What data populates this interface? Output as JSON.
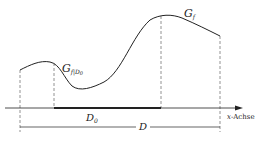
{
  "diagram": {
    "colors": {
      "stroke": "#222222",
      "dashed": "#777777",
      "background": "#ffffff"
    },
    "labels": {
      "graph_f": {
        "main": "G",
        "sub": "f"
      },
      "graph_restricted": {
        "main": "G",
        "sub": "f|D",
        "subsub": "0"
      },
      "subdomain": {
        "main": "D",
        "sub": "0"
      },
      "domain": "D",
      "axis": {
        "var": "x",
        "rest": "-Achse"
      }
    }
  }
}
